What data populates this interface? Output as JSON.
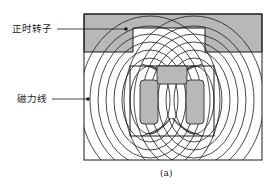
{
  "figure": {
    "caption": "(a)",
    "labels": {
      "timing_rotor": "正时转子",
      "flux_lines": "磁力线"
    },
    "colors": {
      "shade": "#b8b8b8",
      "line": "#1a1a1a",
      "background": "#ffffff"
    }
  }
}
